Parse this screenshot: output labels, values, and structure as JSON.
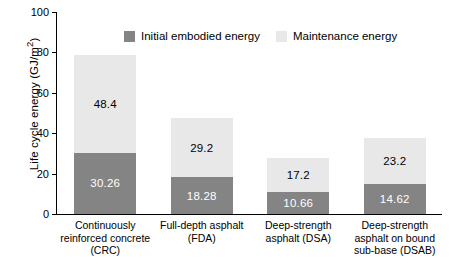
{
  "chart_data": {
    "type": "bar",
    "stacked": true,
    "title": "",
    "xlabel": "",
    "ylabel": "Life cycle energy (GJ/m",
    "ylabel_suffix": ")",
    "ylabel_exponent": "2",
    "ylim": [
      0,
      100
    ],
    "yticks": [
      0,
      20,
      40,
      60,
      80,
      100
    ],
    "ytick_labels": [
      "0",
      "20",
      "40",
      "60",
      "80",
      "100"
    ],
    "grid": false,
    "legend_position": "top-center",
    "categories": [
      "Continuously\nreinforced concrete\n(CRC)",
      "Full-depth asphalt\n(FDA)",
      "Deep-strength\nasphalt (DSA)",
      "Deep-strength\nasphalt on bound\nsub-base (DSAB)"
    ],
    "category_lines": [
      [
        "Continuously",
        "reinforced concrete",
        "(CRC)"
      ],
      [
        "Full-depth asphalt",
        "(FDA)"
      ],
      [
        "Deep-strength",
        "asphalt (DSA)"
      ],
      [
        "Deep-strength",
        "asphalt on bound",
        "sub-base (DSAB)"
      ]
    ],
    "series": [
      {
        "name": "Initial embodied energy",
        "color": "#848484",
        "values": [
          30.26,
          18.28,
          10.66,
          14.62
        ],
        "labels": [
          "30.26",
          "18.28",
          "10.66",
          "14.62"
        ]
      },
      {
        "name": "Maintenance energy",
        "color": "#e8e8e8",
        "values": [
          48.4,
          29.2,
          17.2,
          23.2
        ],
        "labels": [
          "48.4",
          "29.2",
          "17.2",
          "23.2"
        ]
      }
    ],
    "totals": [
      78.66,
      47.48,
      27.86,
      37.82
    ]
  },
  "legend": {
    "items": [
      {
        "label": "Initial embodied energy",
        "swatch": "embodied"
      },
      {
        "label": "Maintenance energy",
        "swatch": "maintenance"
      }
    ]
  }
}
